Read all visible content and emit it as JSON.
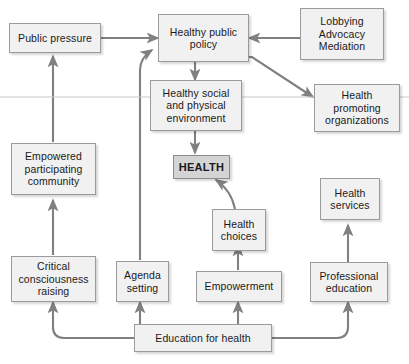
{
  "diagram": {
    "colors": {
      "box_fill": "#f1f1f1",
      "box_fill_accent": "#d4d4d4",
      "box_border": "#9b9b9b",
      "connector": "#808080",
      "text": "#1a1a1a",
      "background": "#ffffff",
      "rule": "#c9c9c9"
    },
    "nodes": [
      {
        "id": "public-pressure",
        "label": "Public pressure"
      },
      {
        "id": "healthy-public-policy",
        "label": "Healthy public\npolicy"
      },
      {
        "id": "lobbying-advocacy",
        "label": "Lobbying\nAdvocacy\nMediation"
      },
      {
        "id": "healthy-environment",
        "label": "Healthy social\nand physical\nenvironment"
      },
      {
        "id": "health-promoting-orgs",
        "label": "Health\npromoting\norganizations"
      },
      {
        "id": "empowered-community",
        "label": "Empowered\nparticipating\ncommunity"
      },
      {
        "id": "health",
        "label": "HEALTH"
      },
      {
        "id": "health-services",
        "label": "Health\nservices"
      },
      {
        "id": "health-choices",
        "label": "Health\nchoices"
      },
      {
        "id": "critical-consciousness",
        "label": "Critical\nconsciousness\nraising"
      },
      {
        "id": "agenda-setting",
        "label": "Agenda\nsetting"
      },
      {
        "id": "empowerment",
        "label": "Empowerment"
      },
      {
        "id": "professional-education",
        "label": "Professional\neducation"
      },
      {
        "id": "education-for-health",
        "label": "Education for health"
      }
    ],
    "edges": [
      {
        "from": "public-pressure",
        "to": "healthy-public-policy"
      },
      {
        "from": "lobbying-advocacy",
        "to": "healthy-public-policy"
      },
      {
        "from": "healthy-public-policy",
        "to": "healthy-environment"
      },
      {
        "from": "healthy-public-policy",
        "to": "health-promoting-orgs"
      },
      {
        "from": "healthy-environment",
        "to": "health"
      },
      {
        "from": "health-choices",
        "to": "health"
      },
      {
        "from": "empowered-community",
        "to": "public-pressure"
      },
      {
        "from": "critical-consciousness",
        "to": "empowered-community"
      },
      {
        "from": "agenda-setting",
        "to": "healthy-public-policy"
      },
      {
        "from": "empowerment",
        "to": "health-choices"
      },
      {
        "from": "professional-education",
        "to": "health-services"
      },
      {
        "from": "education-for-health",
        "to": "critical-consciousness"
      },
      {
        "from": "education-for-health",
        "to": "agenda-setting"
      },
      {
        "from": "education-for-health",
        "to": "empowerment"
      },
      {
        "from": "education-for-health",
        "to": "professional-education"
      }
    ]
  }
}
